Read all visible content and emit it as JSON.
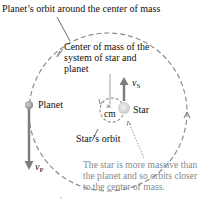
{
  "diagram": {
    "title_label": "Planet’s orbit around the center of mass",
    "cm_label_lines": [
      "Center of mass of the",
      "system of star and",
      "planet"
    ],
    "cm_marker": "×",
    "cm_text": "cm",
    "planet_label": "Planet",
    "star_label": "Star",
    "star_orbit_label": "Star’s orbit",
    "velocity_star": {
      "symbol": "v",
      "subscript": "S"
    },
    "velocity_planet": {
      "symbol": "v",
      "subscript": "P"
    },
    "note_lines": [
      "The star is more massive than",
      "the planet and so orbits closer",
      "to the center of mass."
    ],
    "colors": {
      "orbit_dash": "#8c8c8c",
      "arrow": "#7d7d7d",
      "star": "#d9d9d9",
      "planet": "#a8a8a8",
      "note_text": "#8a8a8a"
    }
  }
}
